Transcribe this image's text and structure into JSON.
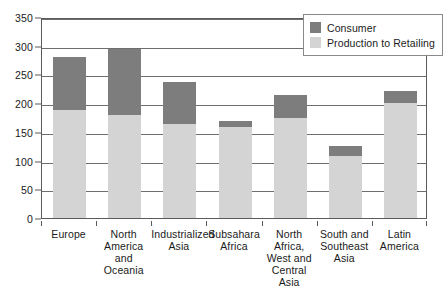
{
  "chart_data": {
    "type": "bar",
    "stacked": true,
    "title": "",
    "xlabel": "",
    "ylabel": "",
    "ylim": [
      0,
      350
    ],
    "ytick_step": 50,
    "yticks": [
      0,
      50,
      100,
      150,
      200,
      250,
      300,
      350
    ],
    "grid": true,
    "legend_position": "top-right",
    "categories": [
      "Europe",
      "North America and Oceania",
      "Industrialized Asia",
      "Subsahara Africa",
      "North Africa, West and Central Asia",
      "South and Southeast Asia",
      "Latin America"
    ],
    "series": [
      {
        "name": "Production to Retailing",
        "color": "#d4d4d4",
        "values": [
          188,
          180,
          164,
          158,
          174,
          108,
          201
        ]
      },
      {
        "name": "Consumer",
        "color": "#7d7d7d",
        "values": [
          93,
          115,
          73,
          11,
          40,
          18,
          21
        ]
      }
    ],
    "totals": [
      281,
      295,
      237,
      169,
      214,
      126,
      222
    ]
  },
  "axes": {
    "y": {
      "ticks": [
        "350",
        "300",
        "250",
        "200",
        "150",
        "100",
        "50",
        "0"
      ],
      "values": [
        350,
        300,
        250,
        200,
        150,
        100,
        50,
        0
      ]
    },
    "x": {
      "labels": [
        [
          "Europe"
        ],
        [
          "North",
          "America and",
          "Oceania"
        ],
        [
          "Industrialized",
          "Asia"
        ],
        [
          "Subsahara",
          "Africa"
        ],
        [
          "North Africa,",
          "West and",
          "Central Asia"
        ],
        [
          "South and",
          "Southeast",
          "Asia"
        ],
        [
          "Latin",
          "America"
        ]
      ]
    }
  },
  "legend": {
    "items": [
      {
        "label": "Consumer",
        "color": "#7d7d7d"
      },
      {
        "label": "Production to Retailing",
        "color": "#d4d4d4"
      }
    ]
  }
}
